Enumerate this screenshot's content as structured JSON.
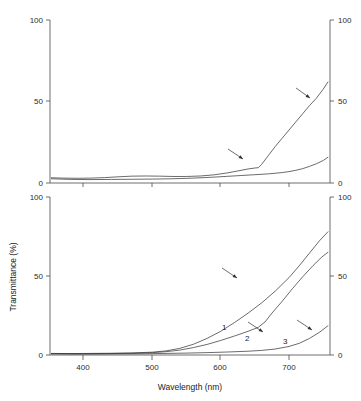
{
  "figure": {
    "title": "",
    "background_color": "#ffffff",
    "line_color": "#3a3a3a",
    "axis_color": "#4a4a4a",
    "text_color": "#1c1c1c"
  },
  "axes": {
    "y_axis_title": "Transmittance (%)",
    "x_axis_title": "Wavelength (nm)",
    "y_ticks": [
      "0",
      "50",
      "100"
    ],
    "y_tick_values": [
      0,
      50,
      100
    ],
    "x_ticks": [
      "400",
      "500",
      "600",
      "700"
    ],
    "x_tick_values": [
      400,
      500,
      600,
      700
    ],
    "y_limits": [
      0,
      100
    ],
    "x_limits": [
      350,
      760
    ],
    "left_axis_labels": [
      "100",
      "50",
      "0"
    ],
    "right_axis_labels": [
      "100",
      "50",
      "0"
    ]
  },
  "chart_data": {
    "type": "line",
    "title": "",
    "xlabel": "Wavelength (nm)",
    "ylabel": "Transmittance (%)",
    "xlim": [
      350,
      760
    ],
    "ylim": [
      0,
      100
    ],
    "grid": false,
    "legend": "none",
    "panels": [
      {
        "panel_id": "top-panel",
        "name": "upper-spectrum-panel",
        "ylim": [
          0,
          100
        ],
        "yticks": [
          0,
          50,
          100
        ],
        "xlim": [
          350,
          760
        ],
        "xticks": [
          400,
          500,
          600,
          700
        ],
        "series": [
          {
            "name": "upper-curve",
            "label": "",
            "x": [
              352,
              370,
              390,
              410,
              430,
              450,
              470,
              490,
              510,
              530,
              550,
              570,
              590,
              610,
              625,
              640,
              650,
              655,
              660,
              670,
              680,
              690,
              700,
              710,
              720,
              730,
              740,
              750,
              757
            ],
            "y": [
              3.2,
              3.0,
              2.9,
              3.0,
              3.3,
              3.8,
              4.2,
              4.3,
              4.2,
              4.0,
              4.0,
              4.3,
              5.0,
              6.2,
              7.4,
              8.6,
              9.2,
              9.4,
              11.5,
              17.0,
              22.5,
              27.5,
              32.5,
              37.5,
              42.5,
              47.5,
              52.0,
              57.5,
              62.0
            ]
          },
          {
            "name": "lower-curve",
            "label": "",
            "x": [
              352,
              380,
              410,
              440,
              470,
              500,
              530,
              560,
              590,
              610,
              630,
              650,
              670,
              690,
              700,
              710,
              720,
              730,
              740,
              750,
              757
            ],
            "y": [
              2.6,
              2.2,
              2.1,
              2.2,
              2.3,
              2.4,
              2.6,
              3.0,
              3.6,
              4.1,
              4.6,
              5.1,
              5.6,
              6.4,
              7.0,
              7.8,
              8.8,
              10.2,
              11.8,
              13.8,
              15.8
            ]
          }
        ],
        "annotations": [
          {
            "name": "arrow-upper-curve",
            "type": "arrow",
            "x1": 296,
            "y1": 88,
            "x2": 310,
            "y2": 98
          },
          {
            "name": "arrow-lower-curve",
            "type": "arrow",
            "x1": 228,
            "y1": 149,
            "x2": 243,
            "y2": 159
          }
        ]
      },
      {
        "panel_id": "bottom-panel",
        "name": "lower-spectrum-panel",
        "ylim": [
          0,
          100
        ],
        "yticks": [
          0,
          50,
          100
        ],
        "xlim": [
          350,
          760
        ],
        "xticks": [
          400,
          500,
          600,
          700
        ],
        "series": [
          {
            "name": "curve-1",
            "label": "1",
            "x": [
              352,
              380,
              410,
              440,
              470,
              500,
              520,
              540,
              560,
              580,
              600,
              620,
              640,
              660,
              680,
              700,
              715,
              730,
              745,
              757
            ],
            "y": [
              1.0,
              0.9,
              1.0,
              1.1,
              1.3,
              1.8,
              2.6,
              4.2,
              6.8,
              10.5,
              15.0,
              20.5,
              26.5,
              33.0,
              40.5,
              49.0,
              56.5,
              64.5,
              72.5,
              78.0
            ]
          },
          {
            "name": "curve-2",
            "label": "2",
            "x": [
              352,
              390,
              430,
              470,
              500,
              520,
              540,
              560,
              580,
              600,
              620,
              640,
              655,
              665,
              675,
              690,
              705,
              720,
              735,
              748,
              757
            ],
            "y": [
              0.9,
              0.8,
              0.9,
              1.1,
              1.5,
              2.1,
              3.1,
              4.7,
              6.7,
              9.2,
              12.0,
              15.0,
              17.5,
              21.0,
              26.5,
              34.0,
              42.0,
              49.5,
              56.5,
              62.0,
              65.0
            ]
          },
          {
            "name": "curve-3",
            "label": "3",
            "x": [
              352,
              400,
              450,
              490,
              520,
              550,
              580,
              610,
              640,
              660,
              680,
              700,
              715,
              730,
              745,
              757
            ],
            "y": [
              0.7,
              0.6,
              0.7,
              0.8,
              1.0,
              1.2,
              1.5,
              1.9,
              2.4,
              2.9,
              3.8,
              5.4,
              7.4,
              10.5,
              14.5,
              18.5
            ]
          }
        ],
        "annotations": [
          {
            "name": "arrow-curve-1",
            "type": "arrow",
            "x1": 222,
            "y1": 268,
            "x2": 237,
            "y2": 278
          },
          {
            "name": "arrow-curve-2",
            "type": "arrow",
            "x1": 248,
            "y1": 322,
            "x2": 263,
            "y2": 332
          },
          {
            "name": "arrow-curve-3",
            "type": "arrow",
            "x1": 297,
            "y1": 320,
            "x2": 312,
            "y2": 330
          }
        ],
        "series_labels": [
          {
            "name": "curve-1-label",
            "text": "1",
            "x": 222,
            "y": 330
          },
          {
            "name": "curve-2-label",
            "text": "2",
            "x": 245,
            "y": 341
          },
          {
            "name": "curve-3-label",
            "text": "3",
            "x": 283,
            "y": 344
          }
        ]
      }
    ]
  }
}
